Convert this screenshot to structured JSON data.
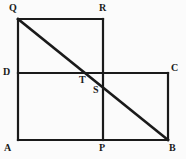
{
  "figure": {
    "background_color": "#fbfbfb",
    "stroke_color": "#1a1a1a",
    "label_color": "#1a1a1a",
    "canvas": {
      "width": 186,
      "height": 159
    },
    "points": {
      "A": {
        "label": "A",
        "x": 18,
        "y": 140,
        "label_x": 4,
        "label_y": 143
      },
      "B": {
        "label": "B",
        "x": 168,
        "y": 140,
        "label_x": 169,
        "label_y": 143
      },
      "C": {
        "label": "C",
        "x": 168,
        "y": 73,
        "label_x": 171,
        "label_y": 63
      },
      "D": {
        "label": "D",
        "x": 18,
        "y": 73,
        "label_x": 3,
        "label_y": 67
      },
      "P": {
        "label": "P",
        "x": 103,
        "y": 140,
        "label_x": 99,
        "label_y": 143
      },
      "Q": {
        "label": "Q",
        "x": 18,
        "y": 19,
        "label_x": 9,
        "label_y": 3
      },
      "R": {
        "label": "R",
        "x": 103,
        "y": 19,
        "label_x": 99,
        "label_y": 3
      },
      "S": {
        "label": "S",
        "x": 103,
        "y": 86,
        "label_x": 93,
        "label_y": 85
      },
      "T": {
        "label": "T",
        "x": 86,
        "y": 73,
        "label_x": 79,
        "label_y": 75
      }
    },
    "segments": [
      {
        "name": "side-QR-top",
        "from": "Q",
        "to": "R",
        "width": 2.2
      },
      {
        "name": "side-QA-left",
        "from": "Q",
        "to": "A",
        "width": 2.2
      },
      {
        "name": "side-RP-vertical",
        "from": "R",
        "to": "P",
        "width": 2.2
      },
      {
        "name": "side-AB-bottom",
        "from": "A",
        "to": "B",
        "width": 2.2
      },
      {
        "name": "side-DC-horizontal",
        "from": "D",
        "to": "C",
        "width": 2.2
      },
      {
        "name": "side-CB-right",
        "from": "C",
        "to": "B",
        "width": 2.2
      },
      {
        "name": "diagonal-QB",
        "from": "Q",
        "to": "B",
        "width": 2.6
      }
    ]
  }
}
